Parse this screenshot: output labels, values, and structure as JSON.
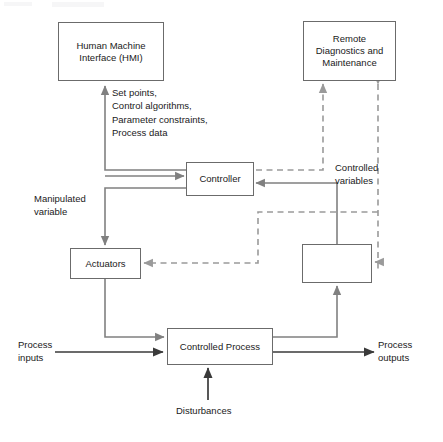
{
  "diagram": {
    "colors": {
      "box_border": "#6b6b6b",
      "solid_arrow": "#808080",
      "dashed_arrow": "#9a9a9a",
      "text": "#1a1a1a",
      "background": "#ffffff"
    },
    "nodes": [
      {
        "id": "hmi",
        "label": "Human Machine\nInterface  (HMI)"
      },
      {
        "id": "remote",
        "label": "Remote\nDiagnostics and\nMaintenance"
      },
      {
        "id": "controller",
        "label": "Controller"
      },
      {
        "id": "actuators",
        "label": "Actuators"
      },
      {
        "id": "sensors",
        "label": ""
      },
      {
        "id": "process",
        "label": "Controlled Process"
      }
    ],
    "labels": [
      {
        "id": "signals",
        "text": "Set points,\nControl algorithms,\nParameter constraints,\nProcess data"
      },
      {
        "id": "manipulated",
        "text": "Manipulated\nvariable"
      },
      {
        "id": "controlled",
        "text": "Controlled\nvariables"
      },
      {
        "id": "proc_inputs",
        "text": "Process\ninputs"
      },
      {
        "id": "proc_outputs",
        "text": "Process\noutputs"
      },
      {
        "id": "disturbances",
        "text": "Disturbances"
      }
    ],
    "edges": [
      {
        "from": "controller",
        "to": "hmi",
        "style": "solid",
        "label": "Set points, Control algorithms, Parameter constraints, Process data"
      },
      {
        "from": "hmi",
        "to": "controller",
        "style": "solid",
        "label": ""
      },
      {
        "from": "controller",
        "to": "actuators",
        "style": "solid",
        "label": "Manipulated variable"
      },
      {
        "from": "actuators",
        "to": "process",
        "style": "solid",
        "label": ""
      },
      {
        "from": "process",
        "to": "sensors",
        "style": "solid",
        "label": ""
      },
      {
        "from": "sensors",
        "to": "controller",
        "style": "solid",
        "label": "Controlled variables"
      },
      {
        "from": "remote",
        "to": "controller",
        "style": "dashed",
        "label": ""
      },
      {
        "from": "remote",
        "to": "actuators",
        "style": "dashed",
        "label": ""
      },
      {
        "from": "remote",
        "to": "sensors",
        "style": "dashed",
        "label": ""
      },
      {
        "from": "external",
        "to": "process",
        "style": "solid",
        "label": "Process inputs"
      },
      {
        "from": "process",
        "to": "external",
        "style": "solid",
        "label": "Process outputs"
      },
      {
        "from": "external",
        "to": "process",
        "style": "solid",
        "label": "Disturbances"
      }
    ]
  }
}
